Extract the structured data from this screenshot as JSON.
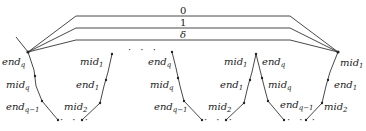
{
  "diagram": {
    "edge_labels": {
      "top": "0",
      "middle": "1",
      "bottom": "δ"
    },
    "ellipsis": "· · ·",
    "ellipsis_top": "· · ·",
    "vertices": {
      "left_apex": {
        "name": "end",
        "sub": "q"
      },
      "right_apex": {
        "name": "mid",
        "sub": "1"
      }
    },
    "segments": [
      {
        "id": "segment-1",
        "left_labels": [
          {
            "name": "end",
            "sub": "q"
          },
          {
            "name": "mid",
            "sub": "q"
          },
          {
            "name": "end",
            "sub": "q−1"
          }
        ],
        "right_labels": [
          {
            "name": "mid",
            "sub": "1"
          },
          {
            "name": "end",
            "sub": "1"
          },
          {
            "name": "mid",
            "sub": "2"
          }
        ]
      },
      {
        "id": "segment-2",
        "left_labels": [
          {
            "name": "end",
            "sub": "q"
          },
          {
            "name": "mid",
            "sub": "q"
          },
          {
            "name": "end",
            "sub": "q−1"
          }
        ],
        "right_labels": [
          {
            "name": "mid",
            "sub": "1"
          },
          {
            "name": "end",
            "sub": "1"
          },
          {
            "name": "mid",
            "sub": "2"
          }
        ]
      },
      {
        "id": "segment-3",
        "left_labels": [
          {
            "name": "end",
            "sub": "q"
          },
          {
            "name": "mid",
            "sub": "q"
          },
          {
            "name": "end",
            "sub": "q−1"
          }
        ],
        "right_labels": [
          {
            "name": "mid",
            "sub": "1"
          },
          {
            "name": "end",
            "sub": "1"
          },
          {
            "name": "mid",
            "sub": "2"
          }
        ]
      }
    ],
    "colors": {
      "stroke": "#333333",
      "text": "#222222",
      "background": "#ffffff"
    }
  }
}
